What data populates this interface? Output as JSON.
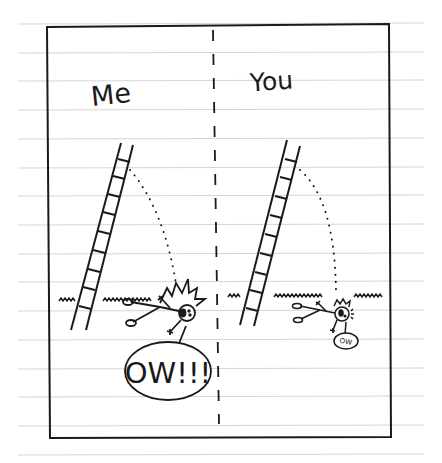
{
  "comic": {
    "left_panel": {
      "label": "Me",
      "speech": "OW!!!"
    },
    "right_panel": {
      "label": "You",
      "speech": "OW"
    }
  },
  "colors": {
    "ink": "#1a1a1a",
    "paper_line": "#d4d4d4",
    "paper": "#ffffff"
  }
}
